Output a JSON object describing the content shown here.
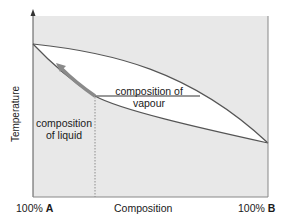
{
  "diagram": {
    "type": "phase-diagram",
    "axes": {
      "y_label": "Temperature",
      "x_label": "Composition",
      "x_left": {
        "prefix": "100% ",
        "component": "A"
      },
      "x_right": {
        "prefix": "100% ",
        "component": "B"
      }
    },
    "annotations": {
      "vapour_line1": "composition of",
      "vapour_line2": "vapour",
      "liquid_line1": "composition",
      "liquid_line2": "of liquid"
    },
    "curves": [
      {
        "name": "vapour-curve",
        "description": "upper boundary (dew line)"
      },
      {
        "name": "liquid-curve",
        "description": "lower boundary (bubble line)"
      }
    ],
    "colors": {
      "background_region": "#e8e8e8",
      "two_phase_region": "#ffffff",
      "curve": "#555555",
      "arrow": "#888888",
      "axis": "#666666"
    }
  }
}
